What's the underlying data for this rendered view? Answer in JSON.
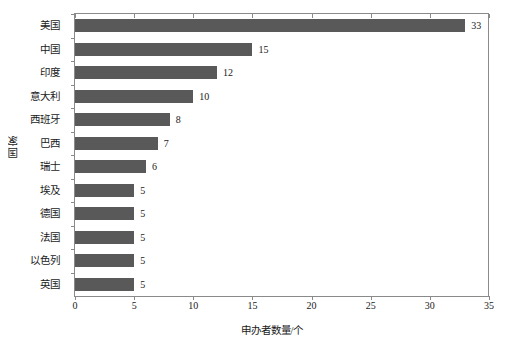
{
  "chart_data": {
    "type": "bar",
    "orientation": "horizontal",
    "title": "",
    "xlabel": "申办者数量/个",
    "ylabel": "国家",
    "xlim": [
      0,
      35
    ],
    "xticks": [
      0,
      5,
      10,
      15,
      20,
      25,
      30,
      35
    ],
    "grid": false,
    "legend": null,
    "bar_color": "#595959",
    "frame_color": "#8a8a8a",
    "categories": [
      "美国",
      "中国",
      "印度",
      "意大利",
      "西班牙",
      "巴西",
      "瑞士",
      "埃及",
      "德国",
      "法国",
      "以色列",
      "英国"
    ],
    "values": [
      33,
      15,
      12,
      10,
      8,
      7,
      6,
      5,
      5,
      5,
      5,
      5
    ],
    "data_labels": [
      "33",
      "15",
      "12",
      "10",
      "8",
      "7",
      "6",
      "5",
      "5",
      "5",
      "5",
      "5"
    ],
    "series": [
      {
        "name": "申办者数量",
        "values": [
          33,
          15,
          12,
          10,
          8,
          7,
          6,
          5,
          5,
          5,
          5,
          5
        ]
      }
    ]
  }
}
